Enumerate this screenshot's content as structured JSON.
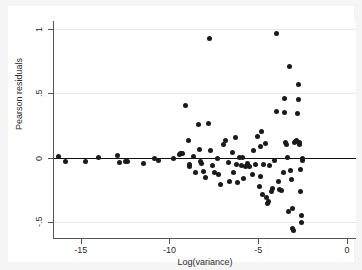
{
  "chart_data": {
    "type": "scatter",
    "title": "",
    "xlabel": "Log(variance)",
    "ylabel": "Pearson residuals",
    "xlim": [
      -16.5,
      0.5
    ],
    "ylim": [
      -0.62,
      1.05
    ],
    "xticks": [
      -15,
      -10,
      -5,
      0
    ],
    "xtick_labels": [
      "-15",
      "-10",
      "-5",
      "0"
    ],
    "yticks": [
      1,
      0.5,
      0,
      -0.5
    ],
    "ytick_labels": [
      "1",
      ".5",
      "0",
      "-.5"
    ],
    "grid": "horizontal",
    "reference_line": {
      "orientation": "horizontal",
      "y": 0,
      "color": "#101010"
    },
    "marker": {
      "shape": "circle",
      "color": "#1a1a1a",
      "size": 5
    },
    "legend": null,
    "background": "#ffffff",
    "figure_background": "#f5f5f5",
    "n_points": 102,
    "points": [
      [
        -16.25,
        0.005
      ],
      [
        -15.85,
        -0.028
      ],
      [
        -14.75,
        -0.028
      ],
      [
        -14.0,
        0.0
      ],
      [
        -12.95,
        0.015
      ],
      [
        -12.8,
        -0.042
      ],
      [
        -12.45,
        -0.03
      ],
      [
        -12.35,
        -0.028
      ],
      [
        -11.45,
        -0.048
      ],
      [
        -10.85,
        -0.007
      ],
      [
        -10.6,
        -0.022
      ],
      [
        -9.75,
        -0.005
      ],
      [
        -9.45,
        0.025
      ],
      [
        -9.4,
        0.03
      ],
      [
        -9.3,
        0.028
      ],
      [
        -9.25,
        0.03
      ],
      [
        -9.1,
        0.41
      ],
      [
        -8.95,
        0.13
      ],
      [
        -8.9,
        -0.07
      ],
      [
        -8.85,
        -0.055
      ],
      [
        -8.65,
        0.005
      ],
      [
        -8.55,
        -0.115
      ],
      [
        -8.35,
        0.26
      ],
      [
        -8.3,
        0.06
      ],
      [
        -8.25,
        -0.03
      ],
      [
        -8.2,
        -0.045
      ],
      [
        -8.1,
        -0.11
      ],
      [
        -8.0,
        -0.155
      ],
      [
        -7.8,
        0.265
      ],
      [
        -7.75,
        0.93
      ],
      [
        -7.7,
        0.055
      ],
      [
        -7.6,
        -0.06
      ],
      [
        -7.45,
        -0.12
      ],
      [
        -7.3,
        -0.005
      ],
      [
        -7.25,
        -0.13
      ],
      [
        -7.15,
        -0.21
      ],
      [
        -6.95,
        0.1
      ],
      [
        -6.85,
        0.13
      ],
      [
        -6.7,
        -0.035
      ],
      [
        -6.6,
        -0.19
      ],
      [
        -6.45,
        0.04
      ],
      [
        -6.4,
        -0.12
      ],
      [
        -6.3,
        0.155
      ],
      [
        -6.25,
        -0.055
      ],
      [
        -6.15,
        -0.195
      ],
      [
        -6.05,
        0.0
      ],
      [
        -5.95,
        -0.06
      ],
      [
        -5.85,
        -0.165
      ],
      [
        -5.7,
        -0.07
      ],
      [
        -5.6,
        -0.05
      ],
      [
        -5.5,
        -0.07
      ],
      [
        -5.35,
        -0.135
      ],
      [
        -5.25,
        0.055
      ],
      [
        -5.15,
        -0.055
      ],
      [
        -5.05,
        0.165
      ],
      [
        -4.95,
        -0.225
      ],
      [
        -4.85,
        0.085
      ],
      [
        -4.8,
        0.2
      ],
      [
        -4.75,
        -0.285
      ],
      [
        -4.7,
        -0.055
      ],
      [
        -4.6,
        0.11
      ],
      [
        -4.55,
        -0.31
      ],
      [
        -4.5,
        -0.355
      ],
      [
        -4.45,
        -0.345
      ],
      [
        -4.35,
        -0.06
      ],
      [
        -4.25,
        -0.265
      ],
      [
        -4.2,
        -0.24
      ],
      [
        -4.1,
        -0.02
      ],
      [
        -4.0,
        0.36
      ],
      [
        -3.95,
        0.965
      ],
      [
        -3.85,
        -0.185
      ],
      [
        -3.8,
        -0.25
      ],
      [
        -3.7,
        -0.26
      ],
      [
        -3.6,
        -0.12
      ],
      [
        -3.55,
        0.46
      ],
      [
        -3.5,
        0.35
      ],
      [
        -3.45,
        0.12
      ],
      [
        -3.4,
        0.105
      ],
      [
        -3.35,
        0.0
      ],
      [
        -3.3,
        -0.42
      ],
      [
        -3.25,
        0.71
      ],
      [
        -3.2,
        -0.1
      ],
      [
        -3.15,
        -0.175
      ],
      [
        -3.1,
        -0.4
      ],
      [
        -3.05,
        -0.555
      ],
      [
        -3.0,
        -0.57
      ],
      [
        -2.95,
        0.115
      ],
      [
        -2.9,
        0.125
      ],
      [
        -2.85,
        0.13
      ],
      [
        -2.8,
        0.34
      ],
      [
        -2.75,
        0.455
      ],
      [
        -2.72,
        0.57
      ],
      [
        -2.7,
        0.12
      ],
      [
        -2.68,
        0.105
      ],
      [
        -2.65,
        -0.095
      ],
      [
        -2.6,
        -0.265
      ],
      [
        -2.58,
        -0.455
      ],
      [
        -2.55,
        -0.51
      ],
      [
        -2.52,
        -0.02
      ],
      [
        -2.5,
        -0.01
      ],
      [
        -5.9,
        0.0
      ],
      [
        -4.9,
        -0.145
      ]
    ]
  }
}
